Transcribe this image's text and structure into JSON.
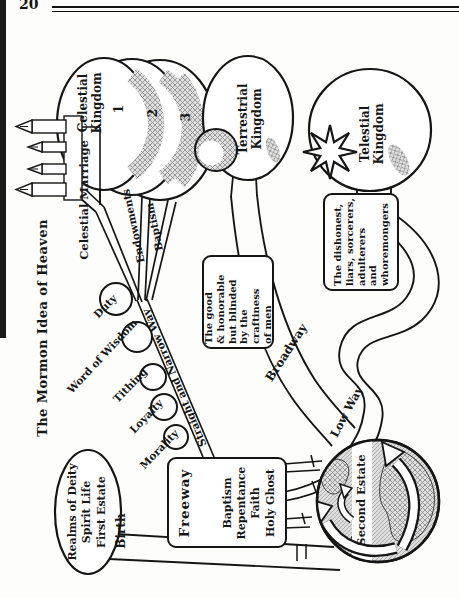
{
  "page": {
    "number": "20"
  },
  "diagram": {
    "title": "The Mormon Idea of Heaven",
    "celestial": {
      "kingdom": "Celestial\nKingdom",
      "circle_numbers": [
        "1",
        "2",
        "3"
      ],
      "marriage": "Celestial Marriage",
      "endowments": "Endowments",
      "baptism": "Baptism"
    },
    "terrestrial": {
      "kingdom": "Terrestrial\nKingdom"
    },
    "telestial": {
      "kingdom": "Telestial\nKingdom"
    },
    "boxes": {
      "good": "The good\n& honorable\nbut blinded\nby the\ncraftiness\nof men",
      "dishonest": "The dishonest,\nliars, sorcerers,\nadulterers\nand\nwhoremongers"
    },
    "paths": {
      "straight_narrow": "Straight and Narrow Way",
      "broadway": "Broadway",
      "low_way": "Low Way",
      "birth": "Birth"
    },
    "freeway": {
      "heading": "Freeway",
      "items": "Baptism\nRepentance\nFaith\nHoly Ghost"
    },
    "stones": [
      "Duty",
      "Word of Wisdom",
      "Tithing",
      "Loyalty",
      "Morality"
    ],
    "origins": {
      "realms": "Realms of Deity\nSpirit Life\nFirst Estate",
      "second_estate": "Second Estate"
    }
  }
}
